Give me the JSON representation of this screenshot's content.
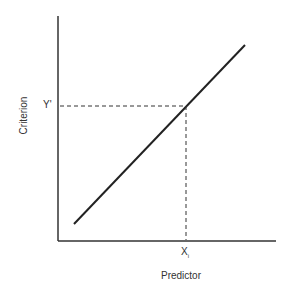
{
  "diagram": {
    "x_axis_label": "Predictor",
    "y_axis_label": "Criterion",
    "x_marker": "X",
    "x_marker_sub": "i",
    "y_marker": "Y'",
    "colors": {
      "line": "#222222",
      "axis": "#333333",
      "dash": "#333333"
    }
  }
}
